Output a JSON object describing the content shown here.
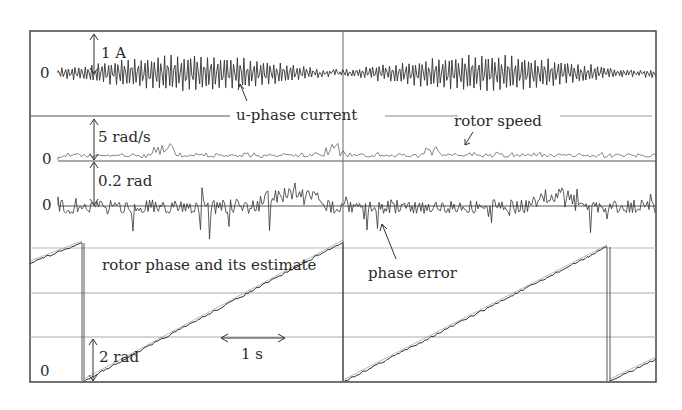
{
  "chart_data": {
    "type": "line",
    "title": "",
    "xlabel": "time",
    "time_scale_label": "1 s",
    "panels": [
      {
        "name": "u-phase current",
        "zero_label": "0",
        "scale_label": "1 A",
        "signal": "sinusoid with modulated amplitude (approx. ±0.35 A peak, beats)",
        "annotation": "u-phase current"
      },
      {
        "name": "rotor speed",
        "zero_label": "0",
        "scale_label": "5 rad/s",
        "signal": "noisy, near zero, small positive excursions (< 5 rad/s)",
        "annotation": "rotor speed"
      },
      {
        "name": "phase error",
        "zero_label": "0",
        "scale_label": "0.2 rad",
        "signal": "noisy around zero, roughly ±0.2 rad",
        "annotation": "phase error"
      },
      {
        "name": "rotor phase and its estimate",
        "zero_label": "0",
        "scale_label": "2 rad",
        "signal": "sawtooth 0 → 2π rad, wraps approx every 2.6 s",
        "annotation": "rotor phase and its estimate",
        "sawtooth_segments_x_frac": [
          [
            0.0,
            0.083
          ],
          [
            0.083,
            0.5
          ],
          [
            0.5,
            0.925
          ],
          [
            0.929,
            1.0
          ]
        ],
        "peak_rad": 6.28
      }
    ],
    "grid": true
  },
  "labels": {
    "current_zero": "0",
    "current_scale": "1 A",
    "current_name": "u-phase current",
    "speed_name": "rotor speed",
    "speed_zero": "0",
    "speed_scale": "5 rad/s",
    "error_zero": "0",
    "error_scale": "0.2 rad",
    "phase_name": "rotor phase and its estimate",
    "error_name": "phase error",
    "time_scale": "1 s",
    "phase_scale": "2 rad",
    "phase_zero": "0"
  },
  "caption": "図 … (caption cut off)"
}
